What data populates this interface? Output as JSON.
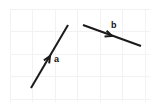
{
  "figure": {
    "type": "vector-diagram",
    "canvas": {
      "width": 158,
      "height": 110
    },
    "background_color": "#ffffff",
    "grid": {
      "visible": true,
      "color": "#f2f2f4",
      "cell_size": 22.5,
      "x_start": 10,
      "y_start": 9,
      "x_lines": [
        10,
        32.5,
        55,
        77.5,
        100,
        122.5,
        145
      ],
      "y_lines": [
        9,
        31.5,
        54,
        76.5,
        99
      ],
      "margin_note": "white margin around grid edges"
    },
    "stroke_color": "#1a1a1a",
    "stroke_width": 2,
    "vectors": [
      {
        "id": "vector-a",
        "label": "a",
        "label_x": 54,
        "label_y": 62,
        "start_x": 31,
        "start_y": 88,
        "end_x": 68,
        "end_y": 25,
        "arrow_x": 50,
        "arrow_y": 56,
        "arrow_direction": "up-right",
        "angle_deg": -59.6
      },
      {
        "id": "vector-b",
        "label": "b",
        "label_x": 111,
        "label_y": 28,
        "start_x": 83,
        "start_y": 25,
        "end_x": 141,
        "end_y": 46,
        "arrow_x": 112,
        "arrow_y": 36,
        "arrow_direction": "down-right",
        "angle_deg": 19.9
      }
    ]
  }
}
